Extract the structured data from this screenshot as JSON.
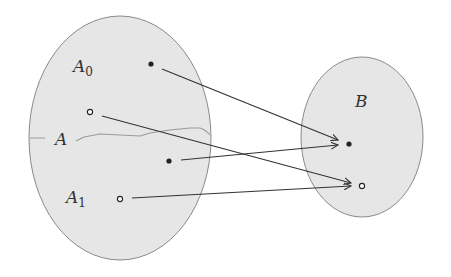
{
  "diagram": {
    "type": "set-mapping",
    "colors": {
      "set_fill": "#e6e6e6",
      "set_stroke": "#8a8a8a",
      "arrow": "#333333",
      "divider": "#9a9a9a",
      "point": "#222222"
    },
    "sets": [
      {
        "id": "A",
        "label": "A",
        "cx": 120,
        "cy": 138,
        "rx": 91,
        "ry": 122
      },
      {
        "id": "B",
        "label": "B",
        "cx": 362,
        "cy": 137,
        "rx": 61,
        "ry": 80
      }
    ],
    "subset_labels": [
      {
        "id": "A0",
        "base": "A",
        "sub": "0"
      },
      {
        "id": "A1",
        "base": "A",
        "sub": "1"
      }
    ],
    "points": [
      {
        "id": "a0",
        "set": "A0",
        "x": 151,
        "y": 64,
        "style": "filled"
      },
      {
        "id": "a1",
        "set": "A0",
        "x": 90,
        "y": 112,
        "style": "hollow"
      },
      {
        "id": "a2",
        "set": "A1",
        "x": 169,
        "y": 161,
        "style": "filled"
      },
      {
        "id": "a3",
        "set": "A1",
        "x": 120,
        "y": 199,
        "style": "hollow"
      },
      {
        "id": "b0",
        "set": "B",
        "x": 349,
        "y": 144,
        "style": "filled"
      },
      {
        "id": "b1",
        "set": "B",
        "x": 362,
        "y": 186,
        "style": "hollow"
      }
    ],
    "arrows": [
      {
        "from": "a0",
        "to": "b0"
      },
      {
        "from": "a1",
        "to": "b1"
      },
      {
        "from": "a2",
        "to": "b0"
      },
      {
        "from": "a3",
        "to": "b1"
      }
    ]
  }
}
